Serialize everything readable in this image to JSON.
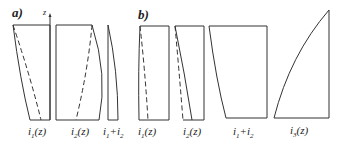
{
  "panels": [
    {
      "id": "a",
      "label": "a)"
    },
    {
      "id": "b",
      "label": "b)"
    }
  ],
  "axis": {
    "label": "z"
  },
  "labels": {
    "a_i1": {
      "base": "i",
      "sub": "1",
      "tail": "(z)"
    },
    "a_i2": {
      "base": "i",
      "sub": "2",
      "tail": "(z)"
    },
    "a_sum": {
      "base": "i",
      "sub": "1",
      "plus": "+i",
      "sub2": "2"
    },
    "b_i1": {
      "base": "i",
      "sub": "1",
      "tail": "(z)"
    },
    "b_i2": {
      "base": "i",
      "sub": "2",
      "tail": "(z)"
    },
    "b_sum": {
      "base": "i",
      "sub": "1",
      "plus": "+i",
      "sub2": "2"
    },
    "b_i3": {
      "base": "i",
      "sub": "3",
      "tail": "(z)"
    }
  },
  "colors": {
    "stroke": "#333333",
    "background": "#ffffff"
  }
}
